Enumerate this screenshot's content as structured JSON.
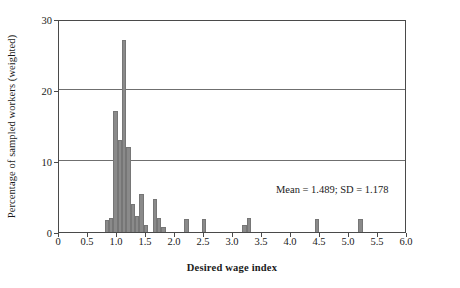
{
  "chart_data": {
    "type": "bar",
    "title": "",
    "xlabel": "Desired wage index",
    "ylabel": "Percentage of sampled workers (weighted)",
    "xlim": [
      0,
      6.0
    ],
    "ylim": [
      0,
      30
    ],
    "xticks": [
      "0",
      "0.5",
      "1.0",
      "1.5",
      "2.0",
      "2.5",
      "3.0",
      "3.5",
      "4.0",
      "4.5",
      "5.0",
      "5.5",
      "6.0"
    ],
    "xtick_values": [
      0,
      0.5,
      1.0,
      1.5,
      2.0,
      2.5,
      3.0,
      3.5,
      4.0,
      4.5,
      5.0,
      5.5,
      6.0
    ],
    "yticks": [
      "0",
      "10",
      "20",
      "30"
    ],
    "ytick_values": [
      0,
      10,
      20,
      30
    ],
    "grid": "horizontal",
    "legend": "none",
    "bar_color": "#8a8a8a",
    "bin_width": 0.075,
    "annotations": [
      {
        "text": "Mean = 1.489; SD = 1.178",
        "x": 3.6,
        "y": 6.5
      }
    ],
    "bins": [
      {
        "x": 0.825,
        "value": 1.7
      },
      {
        "x": 0.9,
        "value": 2.0
      },
      {
        "x": 0.975,
        "value": 17.0
      },
      {
        "x": 1.05,
        "value": 13.0
      },
      {
        "x": 1.125,
        "value": 27.0
      },
      {
        "x": 1.2,
        "value": 12.0
      },
      {
        "x": 1.275,
        "value": 4.0
      },
      {
        "x": 1.35,
        "value": 2.3
      },
      {
        "x": 1.425,
        "value": 5.3
      },
      {
        "x": 1.5,
        "value": 1.0
      },
      {
        "x": 1.65,
        "value": 4.7
      },
      {
        "x": 1.725,
        "value": 2.0
      },
      {
        "x": 1.8,
        "value": 0.7
      },
      {
        "x": 2.2,
        "value": 1.9
      },
      {
        "x": 2.5,
        "value": 1.9
      },
      {
        "x": 3.2,
        "value": 1.0
      },
      {
        "x": 3.275,
        "value": 2.0
      },
      {
        "x": 4.45,
        "value": 1.9
      },
      {
        "x": 5.2,
        "value": 1.9
      }
    ],
    "mean": 1.489,
    "sd": 1.178
  },
  "axes": {
    "x_title": "Desired wage index",
    "y_title": "Percentage of sampled workers (weighted)"
  },
  "annotation": {
    "stats": "Mean = 1.489; SD = 1.178"
  }
}
